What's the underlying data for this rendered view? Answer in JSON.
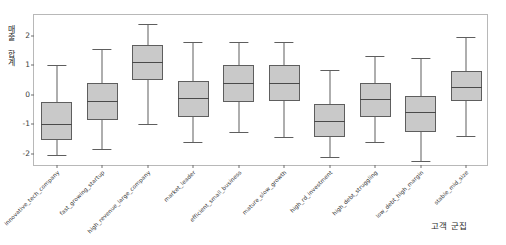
{
  "chart_data": {
    "type": "box",
    "title": "",
    "xlabel": "고객 군집",
    "ylabel": "매출 합계",
    "ylim": [
      -2.45,
      2.7
    ],
    "yticks": [
      2,
      1,
      0,
      -1,
      -2
    ],
    "ytick_labels": [
      "2",
      "1",
      "0",
      "-1",
      "-2"
    ],
    "grid": false,
    "legend": null,
    "box_fill": "#c9c9c9",
    "box_edge": "#5e5e5e",
    "categories": [
      "innovative_tech_company",
      "fast_growing_startup",
      "high_revenue_large_company",
      "market_leader",
      "efficient_small_business",
      "mature_slow_growth",
      "high_rd_investment",
      "high_debt_struggling",
      "low_debt_high_margin",
      "stable_mid_size"
    ],
    "boxes": [
      {
        "label": "innovative_tech_company",
        "whisker_low": -2.05,
        "q1": -1.55,
        "median": -1.0,
        "q3": -0.25,
        "whisker_high": 1.0
      },
      {
        "label": "fast_growing_startup",
        "whisker_low": -1.85,
        "q1": -0.85,
        "median": -0.2,
        "q3": 0.4,
        "whisker_high": 1.55
      },
      {
        "label": "high_revenue_large_company",
        "whisker_low": -1.0,
        "q1": 0.5,
        "median": 1.1,
        "q3": 1.7,
        "whisker_high": 2.4
      },
      {
        "label": "market_leader",
        "whisker_low": -1.6,
        "q1": -0.75,
        "median": -0.1,
        "q3": 0.45,
        "whisker_high": 1.8
      },
      {
        "label": "efficient_small_business",
        "whisker_low": -1.25,
        "q1": -0.25,
        "median": 0.4,
        "q3": 1.0,
        "whisker_high": 1.8
      },
      {
        "label": "mature_slow_growth",
        "whisker_low": -1.45,
        "q1": -0.2,
        "median": 0.4,
        "q3": 1.0,
        "whisker_high": 1.8
      },
      {
        "label": "high_rd_investment",
        "whisker_low": -2.1,
        "q1": -1.45,
        "median": -0.9,
        "q3": -0.3,
        "whisker_high": 0.85
      },
      {
        "label": "high_debt_struggling",
        "whisker_low": -1.6,
        "q1": -0.75,
        "median": -0.15,
        "q3": 0.4,
        "whisker_high": 1.3
      },
      {
        "label": "low_debt_high_margin",
        "whisker_low": -2.25,
        "q1": -1.25,
        "median": -0.6,
        "q3": -0.05,
        "whisker_high": 1.25
      },
      {
        "label": "stable_mid_size",
        "whisker_low": -1.4,
        "q1": -0.2,
        "median": 0.25,
        "q3": 0.8,
        "whisker_high": 1.95
      }
    ]
  }
}
